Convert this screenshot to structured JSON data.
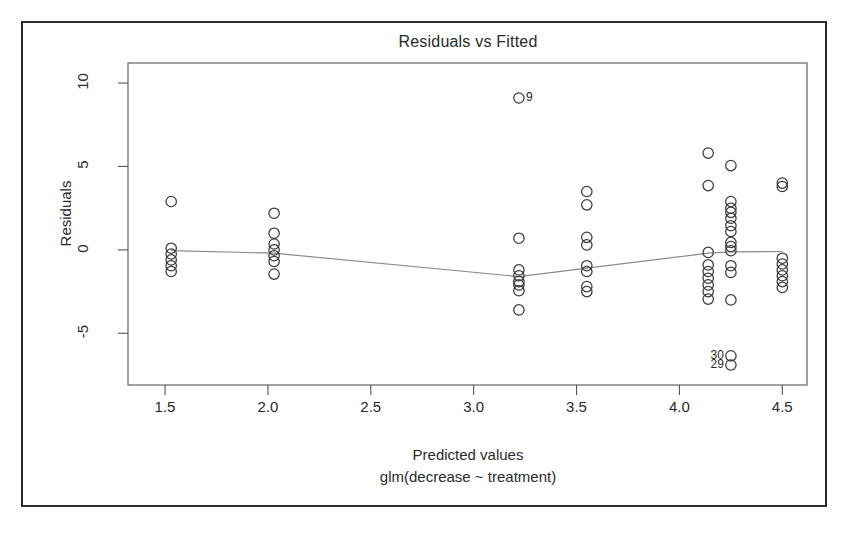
{
  "figure": {
    "title": "Residuals vs Fitted",
    "xlabel_line1": "Predicted values",
    "xlabel_line2": "glm(decrease ~ treatment)",
    "ylabel": "Residuals",
    "frame_color": "#2b2b2b",
    "axis_color": "#555555",
    "point_color": "#3a3a3a",
    "line_color": "#8a8a8a"
  },
  "chart_data": {
    "type": "scatter",
    "title": "Residuals vs Fitted",
    "xlabel": "Predicted values\nglm(decrease ~ treatment)",
    "ylabel": "Residuals",
    "xlim": [
      1.32,
      4.62
    ],
    "ylim": [
      -8.1,
      11.2
    ],
    "xticks": [
      1.5,
      2.0,
      2.5,
      3.0,
      3.5,
      4.0,
      4.5
    ],
    "xtick_labels": [
      "1.5",
      "2.0",
      "2.5",
      "3.0",
      "3.5",
      "4.0",
      "4.5"
    ],
    "yticks": [
      10,
      5,
      0,
      -5
    ],
    "ytick_labels": [
      "10",
      "5",
      "0",
      "-5"
    ],
    "grid": false,
    "legend": null,
    "points": [
      {
        "x": 1.53,
        "y": 2.9
      },
      {
        "x": 1.53,
        "y": 0.1
      },
      {
        "x": 1.53,
        "y": -0.25
      },
      {
        "x": 1.53,
        "y": -0.6
      },
      {
        "x": 1.53,
        "y": -0.95
      },
      {
        "x": 1.53,
        "y": -1.3
      },
      {
        "x": 2.03,
        "y": 2.2
      },
      {
        "x": 2.03,
        "y": 1.0
      },
      {
        "x": 2.03,
        "y": 0.35
      },
      {
        "x": 2.03,
        "y": 0.0
      },
      {
        "x": 2.03,
        "y": -0.35
      },
      {
        "x": 2.03,
        "y": -0.7
      },
      {
        "x": 2.03,
        "y": -1.45
      },
      {
        "x": 3.22,
        "y": 9.1
      },
      {
        "x": 3.22,
        "y": 0.7
      },
      {
        "x": 3.22,
        "y": -1.2
      },
      {
        "x": 3.22,
        "y": -1.55
      },
      {
        "x": 3.22,
        "y": -1.9
      },
      {
        "x": 3.22,
        "y": -2.1
      },
      {
        "x": 3.22,
        "y": -2.45
      },
      {
        "x": 3.22,
        "y": -3.6
      },
      {
        "x": 3.55,
        "y": 3.5
      },
      {
        "x": 3.55,
        "y": 2.7
      },
      {
        "x": 3.55,
        "y": 0.75
      },
      {
        "x": 3.55,
        "y": 0.3
      },
      {
        "x": 3.55,
        "y": -0.95
      },
      {
        "x": 3.55,
        "y": -1.3
      },
      {
        "x": 3.55,
        "y": -2.2
      },
      {
        "x": 3.55,
        "y": -2.5
      },
      {
        "x": 4.14,
        "y": 5.8
      },
      {
        "x": 4.14,
        "y": 3.85
      },
      {
        "x": 4.14,
        "y": -0.15
      },
      {
        "x": 4.14,
        "y": -0.9
      },
      {
        "x": 4.14,
        "y": -1.3
      },
      {
        "x": 4.14,
        "y": -1.7
      },
      {
        "x": 4.14,
        "y": -2.1
      },
      {
        "x": 4.14,
        "y": -2.5
      },
      {
        "x": 4.14,
        "y": -2.95
      },
      {
        "x": 4.25,
        "y": 5.05
      },
      {
        "x": 4.25,
        "y": 2.9
      },
      {
        "x": 4.25,
        "y": 2.5
      },
      {
        "x": 4.25,
        "y": 2.25
      },
      {
        "x": 4.25,
        "y": 1.9
      },
      {
        "x": 4.25,
        "y": 1.45
      },
      {
        "x": 4.25,
        "y": 1.1
      },
      {
        "x": 4.25,
        "y": 0.45
      },
      {
        "x": 4.25,
        "y": 0.2
      },
      {
        "x": 4.25,
        "y": -0.05
      },
      {
        "x": 4.25,
        "y": -0.95
      },
      {
        "x": 4.25,
        "y": -1.35
      },
      {
        "x": 4.25,
        "y": -3.0
      },
      {
        "x": 4.25,
        "y": -6.35
      },
      {
        "x": 4.25,
        "y": -6.9
      },
      {
        "x": 4.5,
        "y": 4.0
      },
      {
        "x": 4.5,
        "y": 3.8
      },
      {
        "x": 4.5,
        "y": -0.5
      },
      {
        "x": 4.5,
        "y": -0.85
      },
      {
        "x": 4.5,
        "y": -1.2
      },
      {
        "x": 4.5,
        "y": -1.55
      },
      {
        "x": 4.5,
        "y": -1.9
      },
      {
        "x": 4.5,
        "y": -2.25
      }
    ],
    "labeled_points": [
      {
        "label": "9",
        "x": 3.22,
        "y": 9.1,
        "anchor": "right"
      },
      {
        "label": "30",
        "x": 4.25,
        "y": -6.35,
        "anchor": "left"
      },
      {
        "label": "29",
        "x": 4.25,
        "y": -6.9,
        "anchor": "left"
      }
    ],
    "smoother": {
      "name": "lowess",
      "x": [
        1.53,
        2.03,
        3.22,
        3.55,
        4.14,
        4.25,
        4.5
      ],
      "y": [
        -0.05,
        -0.2,
        -1.6,
        -1.1,
        -0.2,
        -0.12,
        -0.1
      ]
    }
  }
}
